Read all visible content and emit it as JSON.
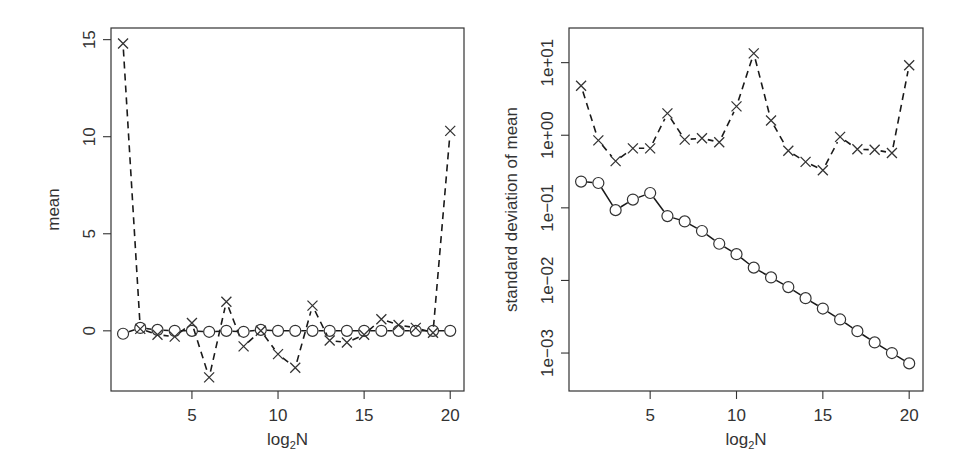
{
  "chart_data": [
    {
      "type": "line",
      "title": "",
      "xlabel": "log2N",
      "xlabel_main": "log",
      "xlabel_sub": "2",
      "xlabel_tail": "N",
      "ylabel": "mean",
      "yscale": "linear",
      "xlim": [
        0.3,
        20.8
      ],
      "ylim": [
        -3.1,
        15.6
      ],
      "x_ticks": [
        5,
        10,
        15,
        20
      ],
      "x_tick_labels": [
        "5",
        "10",
        "15",
        "20"
      ],
      "y_ticks": [
        0,
        5,
        10,
        15
      ],
      "y_tick_labels": [
        "0",
        "5",
        "10",
        "15"
      ],
      "grid": false,
      "legend": null,
      "x": [
        1,
        2,
        3,
        4,
        5,
        6,
        7,
        8,
        9,
        10,
        11,
        12,
        13,
        14,
        15,
        16,
        17,
        18,
        19,
        20
      ],
      "series": [
        {
          "name": "crosses (dashed)",
          "marker": "x",
          "linestyle": "dashed",
          "values": [
            14.8,
            0.1,
            -0.2,
            -0.3,
            0.4,
            -2.4,
            1.5,
            -0.8,
            0.0,
            -1.2,
            -1.9,
            1.3,
            -0.5,
            -0.6,
            -0.2,
            0.6,
            0.3,
            0.15,
            -0.1,
            10.3
          ]
        },
        {
          "name": "circles (solid)",
          "marker": "o",
          "linestyle": "solid",
          "values": [
            -0.15,
            0.15,
            0.05,
            0.0,
            0.0,
            -0.05,
            0.0,
            -0.05,
            0.05,
            0.0,
            0.0,
            0.0,
            0.0,
            0.0,
            0.0,
            0.0,
            0.0,
            0.0,
            0.0,
            0.0
          ]
        }
      ]
    },
    {
      "type": "line",
      "title": "",
      "xlabel": "log2N",
      "xlabel_main": "log",
      "xlabel_sub": "2",
      "xlabel_tail": "N",
      "ylabel": "standard deviation of mean",
      "yscale": "log",
      "xlim": [
        0.3,
        20.8
      ],
      "ylim": [
        0.0003,
        30
      ],
      "x_ticks": [
        5,
        10,
        15,
        20
      ],
      "x_tick_labels": [
        "5",
        "10",
        "15",
        "20"
      ],
      "y_ticks": [
        0.001,
        0.01,
        0.1,
        1,
        10
      ],
      "y_tick_labels": [
        "1e−03",
        "1e−02",
        "1e−01",
        "1e+00",
        "1e+01"
      ],
      "grid": false,
      "legend": null,
      "x": [
        1,
        2,
        3,
        4,
        5,
        6,
        7,
        8,
        9,
        10,
        11,
        12,
        13,
        14,
        15,
        16,
        17,
        18,
        19,
        20
      ],
      "series": [
        {
          "name": "crosses (dashed)",
          "marker": "x",
          "linestyle": "dashed",
          "values": [
            4.8,
            0.85,
            0.44,
            0.66,
            0.66,
            2.0,
            0.87,
            0.91,
            0.8,
            2.5,
            13.4,
            1.6,
            0.61,
            0.43,
            0.33,
            0.95,
            0.64,
            0.63,
            0.57,
            9.2
          ]
        },
        {
          "name": "circles (solid)",
          "marker": "o",
          "linestyle": "solid",
          "values": [
            0.23,
            0.22,
            0.093,
            0.13,
            0.16,
            0.077,
            0.065,
            0.048,
            0.032,
            0.023,
            0.015,
            0.011,
            0.0081,
            0.0057,
            0.0041,
            0.0029,
            0.002,
            0.0014,
            0.001,
            0.00072
          ]
        }
      ]
    }
  ],
  "style": {
    "axis_color": "#333333",
    "line_color": "#1a1a1a",
    "marker_color": "#333333",
    "background": "#ffffff"
  }
}
